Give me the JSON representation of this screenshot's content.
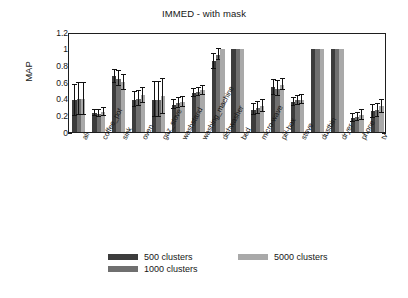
{
  "chart_data": {
    "type": "bar",
    "title": "IMMED - with mask",
    "xlabel": "",
    "ylabel": "MAP",
    "ylim": [
      0,
      1.2
    ],
    "yticks": [
      "0",
      "0.2",
      "0.4",
      "0.6",
      "0.8",
      "1",
      "1.2"
    ],
    "ytick_values": [
      0,
      0.2,
      0.4,
      0.6,
      0.8,
      1,
      1.2
    ],
    "grid": false,
    "legend_position": "bottom",
    "categories": [
      "all",
      "coffee_pot",
      "sink",
      "oven",
      "gaz_stove",
      "washstand",
      "washing_machine",
      "dishwasher",
      "bed",
      "micro-wave",
      "pill-box",
      "stove",
      "dustbin",
      "dryer",
      "phone",
      "tv"
    ],
    "series": [
      {
        "name": "500 clusters",
        "color": "#3c3c3c",
        "values": [
          0.38,
          0.23,
          0.67,
          0.39,
          0.39,
          0.33,
          0.47,
          0.85,
          1.0,
          0.27,
          0.54,
          0.36,
          1.0,
          1.0,
          0.17,
          0.25
        ],
        "errors": [
          0.19,
          0.04,
          0.08,
          0.09,
          0.21,
          0.05,
          0.05,
          0.09,
          0.0,
          0.07,
          0.09,
          0.05,
          0.0,
          0.0,
          0.05,
          0.08
        ]
      },
      {
        "name": "1000 clusters",
        "color": "#6f6f6f",
        "values": [
          0.4,
          0.22,
          0.64,
          0.4,
          0.39,
          0.35,
          0.48,
          0.93,
          1.0,
          0.29,
          0.52,
          0.38,
          1.0,
          1.0,
          0.18,
          0.26
        ],
        "errors": [
          0.19,
          0.04,
          0.09,
          0.09,
          0.21,
          0.06,
          0.05,
          0.07,
          0.0,
          0.07,
          0.09,
          0.05,
          0.0,
          0.0,
          0.05,
          0.08
        ]
      },
      {
        "name": "5000 clusters",
        "color": "#a9a9a9",
        "values": [
          0.4,
          0.24,
          0.6,
          0.44,
          0.43,
          0.36,
          0.5,
          1.0,
          1.0,
          0.31,
          0.57,
          0.39,
          1.0,
          1.0,
          0.21,
          0.31
        ],
        "errors": [
          0.19,
          0.05,
          0.09,
          0.09,
          0.21,
          0.06,
          0.05,
          0.0,
          0.0,
          0.07,
          0.07,
          0.05,
          0.0,
          0.0,
          0.06,
          0.08
        ]
      }
    ]
  },
  "legend": {
    "entries": [
      {
        "label": "500 clusters",
        "color": "#3c3c3c"
      },
      {
        "label": "1000 clusters",
        "color": "#6f6f6f"
      },
      {
        "label": "5000 clusters",
        "color": "#a9a9a9"
      }
    ]
  }
}
